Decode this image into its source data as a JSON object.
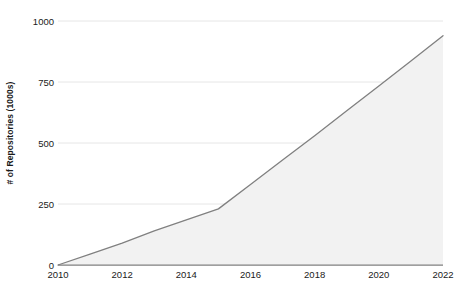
{
  "chart_data": {
    "type": "area",
    "title": "",
    "subtitle": "",
    "xlabel": "",
    "ylabel": "# of Repositories (1000s)",
    "x": [
      2010,
      2011,
      2012,
      2013,
      2014,
      2015,
      2016,
      2017,
      2018,
      2019,
      2020,
      2021,
      2022
    ],
    "values": [
      0,
      45,
      90,
      140,
      185,
      230,
      330,
      430,
      530,
      632,
      734,
      836,
      940
    ],
    "series": [
      {
        "name": "# of Repositories (1000s)",
        "values": [
          0,
          45,
          90,
          140,
          185,
          230,
          330,
          430,
          530,
          632,
          734,
          836,
          940
        ]
      }
    ],
    "xlim": [
      2010,
      2022
    ],
    "ylim": [
      0,
      1000
    ],
    "xticks": [
      2010,
      2012,
      2014,
      2016,
      2018,
      2020,
      2022
    ],
    "xtick_labels": [
      "2010",
      "2012",
      "2014",
      "2016",
      "2018",
      "2020",
      "2022"
    ],
    "yticks": [
      0,
      250,
      500,
      750,
      1000
    ],
    "ytick_labels": [
      "0",
      "250",
      "500",
      "750",
      "1000"
    ],
    "grid": "horizontal",
    "legend": "none",
    "annotations": [],
    "colors": {
      "line": "#808080",
      "fill": "#f2f2f2",
      "grid": "#e0e0e0",
      "axis": "#808080",
      "text": "#1a1a1a",
      "background": "#ffffff"
    }
  }
}
